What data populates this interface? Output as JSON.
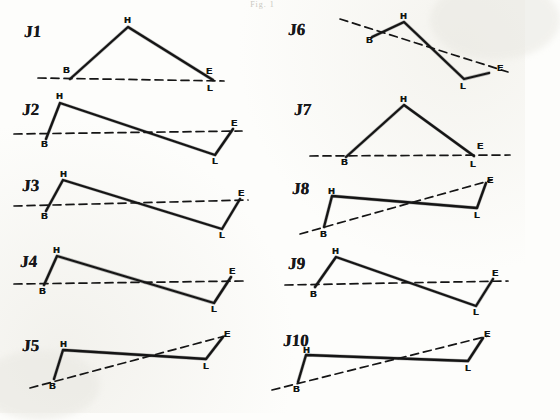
{
  "figure": {
    "caption": "Fig. 1",
    "vertex_labels": [
      "B",
      "H",
      "L",
      "E"
    ],
    "panel_count": 10
  },
  "panels": [
    {
      "id": "J1",
      "label": "J1",
      "label_pos": [
        24,
        22
      ],
      "solid_path": "70,79 128,27 213,80",
      "dashed_path": "38,78 224,81",
      "vertices": [
        {
          "name": "B",
          "x": 68,
          "y": 72,
          "lx": 63,
          "ly": 66
        },
        {
          "name": "H",
          "x": 128,
          "y": 27,
          "lx": 124,
          "ly": 16
        },
        {
          "name": "E",
          "x": 211,
          "y": 76,
          "lx": 206,
          "ly": 67
        },
        {
          "name": "L",
          "x": 212,
          "y": 84,
          "lx": 207,
          "ly": 84
        }
      ]
    },
    {
      "id": "J2",
      "label": "J2",
      "label_pos": [
        22,
        100
      ],
      "solid_path": "46,139 60,103 215,155 233,129",
      "dashed_path": "14,134 242,131",
      "vertices": [
        {
          "name": "H",
          "x": 60,
          "y": 103,
          "lx": 56,
          "ly": 92
        },
        {
          "name": "B",
          "x": 46,
          "y": 139,
          "lx": 41,
          "ly": 140
        },
        {
          "name": "E",
          "x": 233,
          "y": 129,
          "lx": 231,
          "ly": 119
        },
        {
          "name": "L",
          "x": 215,
          "y": 155,
          "lx": 212,
          "ly": 157
        }
      ]
    },
    {
      "id": "J3",
      "label": "J3",
      "label_pos": [
        22,
        176
      ],
      "solid_path": "46,211 63,180 222,229 240,199",
      "dashed_path": "14,206 248,200",
      "vertices": [
        {
          "name": "H",
          "x": 63,
          "y": 180,
          "lx": 60,
          "ly": 170
        },
        {
          "name": "B",
          "x": 46,
          "y": 211,
          "lx": 41,
          "ly": 212
        },
        {
          "name": "E",
          "x": 240,
          "y": 199,
          "lx": 238,
          "ly": 189
        },
        {
          "name": "L",
          "x": 222,
          "y": 229,
          "lx": 219,
          "ly": 231
        }
      ]
    },
    {
      "id": "J4",
      "label": "J4",
      "label_pos": [
        20,
        252
      ],
      "solid_path": "44,285 57,256 214,303 231,277",
      "dashed_path": "14,284 244,281",
      "vertices": [
        {
          "name": "H",
          "x": 57,
          "y": 256,
          "lx": 53,
          "ly": 246
        },
        {
          "name": "B",
          "x": 44,
          "y": 285,
          "lx": 39,
          "ly": 287
        },
        {
          "name": "E",
          "x": 231,
          "y": 277,
          "lx": 229,
          "ly": 267
        },
        {
          "name": "L",
          "x": 214,
          "y": 303,
          "lx": 211,
          "ly": 305
        }
      ]
    },
    {
      "id": "J5",
      "label": "J5",
      "label_pos": [
        22,
        336
      ],
      "solid_path": "54,379 63,350 206,359 223,337",
      "dashed_path": "30,388 225,336",
      "vertices": [
        {
          "name": "H",
          "x": 63,
          "y": 350,
          "lx": 60,
          "ly": 340
        },
        {
          "name": "B",
          "x": 54,
          "y": 379,
          "lx": 49,
          "ly": 382
        },
        {
          "name": "E",
          "x": 223,
          "y": 337,
          "lx": 224,
          "ly": 330
        },
        {
          "name": "L",
          "x": 206,
          "y": 359,
          "lx": 203,
          "ly": 362
        }
      ]
    },
    {
      "id": "J6",
      "label": "J6",
      "label_pos": [
        288,
        20
      ],
      "solid_path": "372,37 404,22 464,79 489,73",
      "dashed_path": "340,19 508,72",
      "vertices": [
        {
          "name": "H",
          "x": 404,
          "y": 22,
          "lx": 400,
          "ly": 12
        },
        {
          "name": "B",
          "x": 372,
          "y": 37,
          "lx": 366,
          "ly": 36
        },
        {
          "name": "E",
          "x": 494,
          "y": 70,
          "lx": 497,
          "ly": 64
        },
        {
          "name": "L",
          "x": 464,
          "y": 79,
          "lx": 460,
          "ly": 82
        }
      ]
    },
    {
      "id": "J7",
      "label": "J7",
      "label_pos": [
        294,
        100
      ],
      "solid_path": "346,157 404,105 474,156",
      "dashed_path": "310,156 510,155",
      "vertices": [
        {
          "name": "H",
          "x": 404,
          "y": 105,
          "lx": 400,
          "ly": 95
        },
        {
          "name": "B",
          "x": 346,
          "y": 157,
          "lx": 341,
          "ly": 158
        },
        {
          "name": "E",
          "x": 476,
          "y": 151,
          "lx": 477,
          "ly": 142
        },
        {
          "name": "L",
          "x": 474,
          "y": 158,
          "lx": 470,
          "ly": 160
        }
      ]
    },
    {
      "id": "J8",
      "label": "J8",
      "label_pos": [
        292,
        179
      ],
      "solid_path": "324,227 332,196 477,208 486,183",
      "dashed_path": "300,234 492,180",
      "vertices": [
        {
          "name": "H",
          "x": 332,
          "y": 196,
          "lx": 328,
          "ly": 187
        },
        {
          "name": "B",
          "x": 324,
          "y": 227,
          "lx": 320,
          "ly": 230
        },
        {
          "name": "E",
          "x": 486,
          "y": 183,
          "lx": 487,
          "ly": 176
        },
        {
          "name": "L",
          "x": 477,
          "y": 208,
          "lx": 474,
          "ly": 211
        }
      ]
    },
    {
      "id": "J9",
      "label": "J9",
      "label_pos": [
        288,
        254
      ],
      "solid_path": "315,287 336,257 476,306 493,279",
      "dashed_path": "285,285 508,281",
      "vertices": [
        {
          "name": "H",
          "x": 336,
          "y": 257,
          "lx": 332,
          "ly": 247
        },
        {
          "name": "B",
          "x": 315,
          "y": 287,
          "lx": 310,
          "ly": 290
        },
        {
          "name": "E",
          "x": 493,
          "y": 279,
          "lx": 492,
          "ly": 269
        },
        {
          "name": "L",
          "x": 476,
          "y": 306,
          "lx": 473,
          "ly": 308
        }
      ]
    },
    {
      "id": "J10",
      "label": "J10",
      "label_pos": [
        283,
        331
      ],
      "solid_path": "298,382 306,355 468,361 483,338",
      "dashed_path": "272,390 488,336",
      "vertices": [
        {
          "name": "H",
          "x": 306,
          "y": 355,
          "lx": 303,
          "ly": 346
        },
        {
          "name": "B",
          "x": 298,
          "y": 382,
          "lx": 293,
          "ly": 385
        },
        {
          "name": "E",
          "x": 483,
          "y": 338,
          "lx": 484,
          "ly": 330
        },
        {
          "name": "L",
          "x": 468,
          "y": 361,
          "lx": 465,
          "ly": 364
        }
      ]
    }
  ],
  "style": {
    "ink": "#151515",
    "paper": "#fdfdfb",
    "dash_pattern": "8,5"
  }
}
